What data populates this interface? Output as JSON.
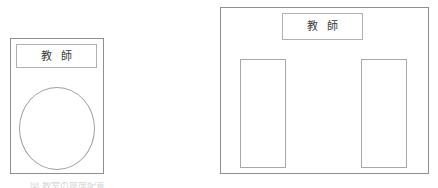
{
  "page": {
    "background_color": "#ffffff",
    "width": 438,
    "height": 188,
    "line_color": "#8f8f8f",
    "text_color": "#3c3c3c"
  },
  "figures": [
    {
      "id": "left",
      "name": "classroom-layout-single-group",
      "outer_shape": "rectangle",
      "label": {
        "text": "教 師",
        "shape": "rectangle",
        "position": "top"
      },
      "elements": [
        {
          "name": "seating-circle",
          "shape": "ellipse",
          "label": ""
        }
      ]
    },
    {
      "id": "right",
      "name": "classroom-layout-two-columns",
      "outer_shape": "rectangle",
      "label": {
        "text": "教 師",
        "shape": "rectangle",
        "position": "top-center"
      },
      "elements": [
        {
          "name": "seating-column-left",
          "shape": "rectangle",
          "label": ""
        },
        {
          "name": "seating-column-right",
          "shape": "rectangle",
          "label": ""
        }
      ]
    }
  ],
  "caption": {
    "text": "図  教室の座席配置"
  }
}
